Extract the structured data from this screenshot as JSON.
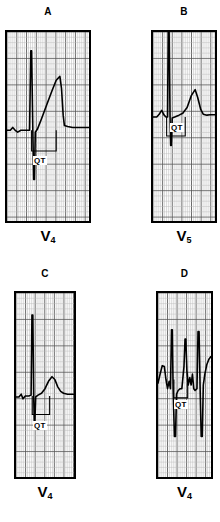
{
  "figure": {
    "title": "",
    "background_color": "#ffffff",
    "trace_color": "#000000",
    "grid_minor_color": "#b9b9b9",
    "grid_major_color": "#555555",
    "border_color": "#000000"
  },
  "panels": [
    {
      "id": "panel-a",
      "letter": "A",
      "lead": "V",
      "lead_subscript": "4",
      "annotation": "QT",
      "chart": {
        "type": "line",
        "description": "ECG strip with tall narrow R wave, deep S wave and broad prolonged T wave",
        "baseline_y": 0.52,
        "qt_bracket": {
          "start_x": 0.3,
          "end_x": 0.6,
          "y": 0.63
        },
        "points": [
          [
            0.0,
            0.52
          ],
          [
            0.04,
            0.52
          ],
          [
            0.07,
            0.505
          ],
          [
            0.1,
            0.52
          ],
          [
            0.13,
            0.53
          ],
          [
            0.17,
            0.52
          ],
          [
            0.25,
            0.52
          ],
          [
            0.275,
            0.52
          ],
          [
            0.29,
            0.1
          ],
          [
            0.3,
            0.1
          ],
          [
            0.315,
            0.52
          ],
          [
            0.325,
            0.78
          ],
          [
            0.335,
            0.78
          ],
          [
            0.345,
            0.53
          ],
          [
            0.37,
            0.515
          ],
          [
            0.42,
            0.46
          ],
          [
            0.48,
            0.39
          ],
          [
            0.55,
            0.31
          ],
          [
            0.6,
            0.255
          ],
          [
            0.645,
            0.235
          ],
          [
            0.665,
            0.3
          ],
          [
            0.685,
            0.44
          ],
          [
            0.7,
            0.495
          ],
          [
            0.74,
            0.5
          ],
          [
            0.8,
            0.505
          ],
          [
            0.86,
            0.505
          ],
          [
            0.93,
            0.505
          ],
          [
            1.0,
            0.505
          ]
        ]
      }
    },
    {
      "id": "panel-b",
      "letter": "B",
      "lead": "V",
      "lead_subscript": "5",
      "annotation": "QT",
      "chart": {
        "type": "line",
        "description": "ECG strip with very tall R wave reaching top of strip and smaller peaked T wave",
        "baseline_y": 0.45,
        "qt_bracket": {
          "start_x": 0.22,
          "end_x": 0.52,
          "y": 0.55
        },
        "points": [
          [
            0.0,
            0.45
          ],
          [
            0.06,
            0.45
          ],
          [
            0.1,
            0.435
          ],
          [
            0.14,
            0.415
          ],
          [
            0.18,
            0.44
          ],
          [
            0.21,
            0.45
          ],
          [
            0.235,
            0.45
          ],
          [
            0.245,
            0.0
          ],
          [
            0.26,
            0.0
          ],
          [
            0.275,
            0.45
          ],
          [
            0.285,
            0.6
          ],
          [
            0.295,
            0.6
          ],
          [
            0.31,
            0.455
          ],
          [
            0.35,
            0.45
          ],
          [
            0.42,
            0.44
          ],
          [
            0.48,
            0.43
          ],
          [
            0.55,
            0.4
          ],
          [
            0.62,
            0.335
          ],
          [
            0.68,
            0.305
          ],
          [
            0.72,
            0.345
          ],
          [
            0.77,
            0.41
          ],
          [
            0.81,
            0.435
          ],
          [
            0.87,
            0.44
          ],
          [
            0.92,
            0.438
          ],
          [
            1.0,
            0.438
          ]
        ]
      }
    },
    {
      "id": "panel-c",
      "letter": "C",
      "lead": "V",
      "lead_subscript": "4",
      "annotation": "QT",
      "chart": {
        "type": "line",
        "description": "ECG strip with narrow tall R wave, small S wave and low rounded T wave",
        "baseline_y": 0.56,
        "qt_bracket": {
          "start_x": 0.28,
          "end_x": 0.58,
          "y": 0.66
        },
        "points": [
          [
            0.0,
            0.565
          ],
          [
            0.05,
            0.565
          ],
          [
            0.09,
            0.55
          ],
          [
            0.12,
            0.575
          ],
          [
            0.16,
            0.56
          ],
          [
            0.22,
            0.56
          ],
          [
            0.26,
            0.555
          ],
          [
            0.275,
            0.12
          ],
          [
            0.29,
            0.12
          ],
          [
            0.305,
            0.56
          ],
          [
            0.315,
            0.7
          ],
          [
            0.325,
            0.7
          ],
          [
            0.34,
            0.565
          ],
          [
            0.38,
            0.555
          ],
          [
            0.44,
            0.545
          ],
          [
            0.5,
            0.52
          ],
          [
            0.56,
            0.48
          ],
          [
            0.62,
            0.455
          ],
          [
            0.67,
            0.47
          ],
          [
            0.72,
            0.51
          ],
          [
            0.77,
            0.535
          ],
          [
            0.82,
            0.545
          ],
          [
            0.89,
            0.55
          ],
          [
            1.0,
            0.55
          ]
        ]
      }
    },
    {
      "id": "panel-d",
      "letter": "D",
      "lead": "V",
      "lead_subscript": "4",
      "annotation": "QT",
      "chart": {
        "type": "line",
        "description": "ECG strip with wide bizarre multiphasic QRS complexes, deep S waves and notched T wave",
        "baseline_y": 0.47,
        "qt_bracket": {
          "start_x": 0.3,
          "end_x": 0.56,
          "y": 0.57
        },
        "points": [
          [
            0.0,
            0.49
          ],
          [
            0.04,
            0.44
          ],
          [
            0.08,
            0.395
          ],
          [
            0.12,
            0.4
          ],
          [
            0.15,
            0.47
          ],
          [
            0.18,
            0.52
          ],
          [
            0.21,
            0.48
          ],
          [
            0.235,
            0.52
          ],
          [
            0.255,
            0.2
          ],
          [
            0.27,
            0.2
          ],
          [
            0.285,
            0.52
          ],
          [
            0.31,
            0.78
          ],
          [
            0.33,
            0.78
          ],
          [
            0.35,
            0.55
          ],
          [
            0.38,
            0.53
          ],
          [
            0.42,
            0.52
          ],
          [
            0.45,
            0.52
          ],
          [
            0.49,
            0.4
          ],
          [
            0.51,
            0.25
          ],
          [
            0.525,
            0.25
          ],
          [
            0.545,
            0.42
          ],
          [
            0.57,
            0.5
          ],
          [
            0.6,
            0.46
          ],
          [
            0.625,
            0.5
          ],
          [
            0.65,
            0.44
          ],
          [
            0.675,
            0.52
          ],
          [
            0.7,
            0.53
          ],
          [
            0.735,
            0.52
          ],
          [
            0.755,
            0.21
          ],
          [
            0.775,
            0.21
          ],
          [
            0.795,
            0.52
          ],
          [
            0.815,
            0.78
          ],
          [
            0.835,
            0.78
          ],
          [
            0.855,
            0.5
          ],
          [
            0.885,
            0.44
          ],
          [
            0.92,
            0.39
          ],
          [
            0.96,
            0.36
          ],
          [
            1.0,
            0.345
          ]
        ]
      }
    }
  ]
}
